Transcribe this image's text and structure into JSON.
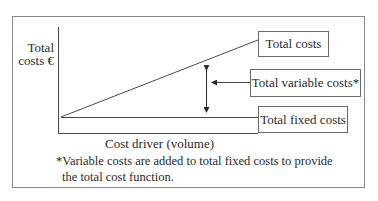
{
  "diagram": {
    "y_axis_label": [
      "Total",
      "costs €"
    ],
    "x_axis_label": "Cost driver (volume)",
    "labels": {
      "total_costs": "Total costs",
      "total_variable_costs": "Total variable costs*",
      "total_fixed_costs": "Total fixed costs"
    },
    "footnote": [
      "*Variable costs are added to total fixed costs to provide",
      "the total cost function."
    ],
    "colors": {
      "line": "#4a4a4a",
      "frame": "#8a8a8a",
      "text": "#2a2a2a"
    }
  }
}
